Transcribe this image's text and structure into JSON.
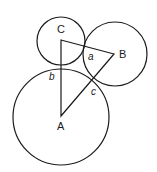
{
  "diagram": {
    "type": "three mutually tangent circles with triangle joining centers",
    "stroke_color": "#1a1a1a",
    "circles": [
      {
        "name": "C",
        "cx": 61,
        "cy": 41,
        "r": 24
      },
      {
        "name": "B",
        "cx": 115,
        "cy": 54,
        "r": 32
      },
      {
        "name": "A",
        "cx": 61,
        "cy": 117,
        "r": 48
      }
    ],
    "triangle": {
      "C": [
        61,
        40
      ],
      "B": [
        114,
        54
      ],
      "A": [
        61,
        116
      ]
    },
    "vertex_labels": {
      "A": "A",
      "B": "B",
      "C": "C"
    },
    "side_labels": {
      "a": "a",
      "b": "b",
      "c": "c"
    }
  }
}
